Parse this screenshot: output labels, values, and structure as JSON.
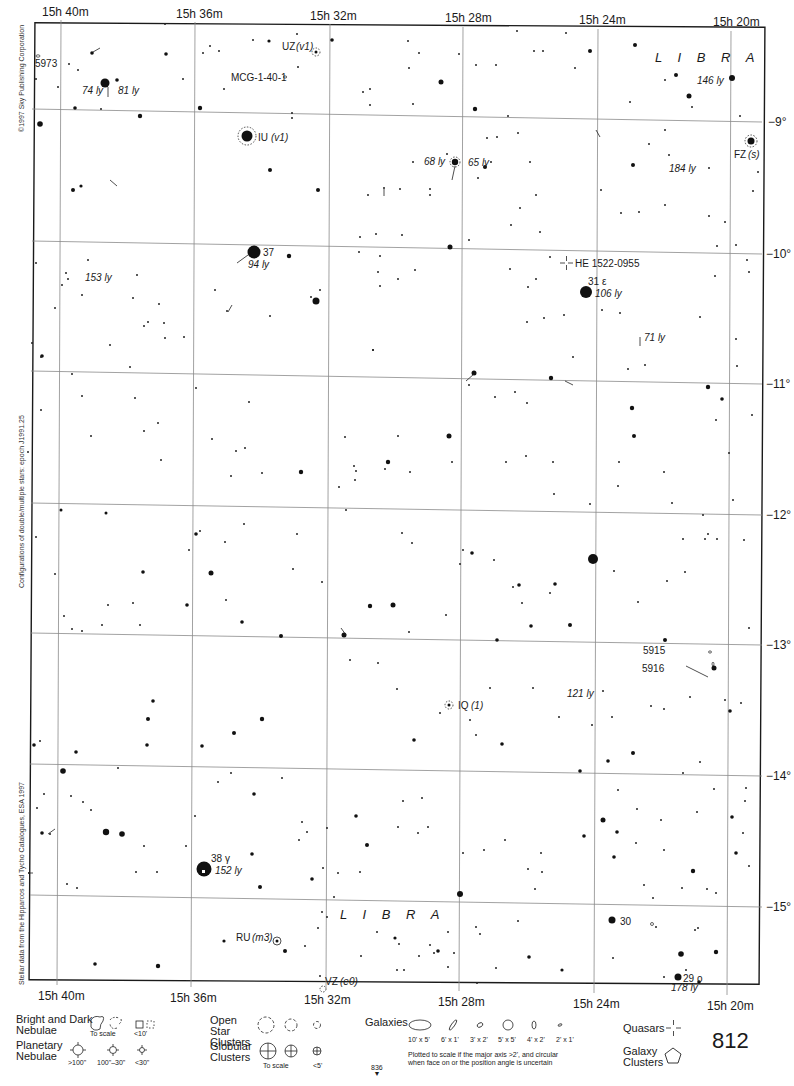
{
  "page": {
    "number": "812",
    "continuation_below": "836",
    "continuation_arrow": "▼"
  },
  "axes": {
    "ra_top": [
      "15h 40m",
      "15h 36m",
      "15h 32m",
      "15h 28m",
      "15h 24m",
      "15h 20m"
    ],
    "ra_bottom": [
      "15h 40m",
      "15h 36m",
      "15h 32m",
      "15h 28m",
      "15h 24m",
      "15h 20m"
    ],
    "dec_right": [
      "−9°",
      "−10°",
      "−11°",
      "−12°",
      "−13°",
      "−14°",
      "−15°"
    ]
  },
  "side_credits": {
    "copyright": "©1997 Sky Publishing Corporation",
    "epoch_note": "Configurations of double/multiple stars: epoch J1991.25",
    "data_source": "Stellar data from the Hipparcos and Tycho Catalogues, ESA 1997"
  },
  "constellation_labels": [
    "L I B R A",
    "L I B R A"
  ],
  "objects": {
    "ngc_5973": "5973",
    "dist_74": "74 ly",
    "dist_81": "81 ly",
    "uz": "UZ",
    "uz_type": "(v1)",
    "mcg": "MCG-1-40-1",
    "iu": "IU",
    "iu_type": "(v1)",
    "dist_146": "146 ly",
    "dist_68": "68 ly",
    "dist_65": "65 ly",
    "fz": "FZ",
    "fz_type": "(s)",
    "dist_184": "184 ly",
    "star_37": "37",
    "dist_94": "94 ly",
    "dist_153": "153 ly",
    "quasar_he": "HE 1522-0955",
    "star_31": "31 ε",
    "dist_106": "106 ly",
    "dist_71": "71 ly",
    "ngc_5915": "5915",
    "ngc_5916": "5916",
    "dist_121": "121 ly",
    "iq": "IQ",
    "iq_type": "(1)",
    "star_38": "38 γ",
    "dist_152": "152 ly",
    "ru": "RU",
    "ru_type": "(m3)",
    "vz": "VZ",
    "vz_type": "(e0)",
    "star_30": "30",
    "star_29": "29 ο",
    "dist_178": "178 ly"
  },
  "legend": {
    "nebulae_title": "Bright and Dark Nebulae",
    "nebulae_to_scale": "To scale",
    "nebulae_small": "<10'",
    "planetary_title": "Planetary Nebulae",
    "planetary_sizes": [
      ">100\"",
      "100\"–30\"",
      "<30\""
    ],
    "open_clusters_title": "Open Star Clusters",
    "globular_title": "Globular Clusters",
    "globular_to_scale": "To scale",
    "globular_small": "<5'",
    "galaxies_title": "Galaxies",
    "galaxy_sizes": [
      "10' x 5'",
      "6' x 1'",
      "3' x 2'",
      "5' x 5'",
      "4' x 2'",
      "2' x 1'"
    ],
    "galaxy_note_1": "Plotted to scale if the major axis >2', and circular",
    "galaxy_note_2": "when face on or the position angle is uncertain",
    "quasars_title": "Quasars",
    "galaxy_clusters_title": "Galaxy Clusters"
  },
  "colors": {
    "ink": "#1a1a1a",
    "grid": "#8a8a8a",
    "background": "#ffffff"
  }
}
